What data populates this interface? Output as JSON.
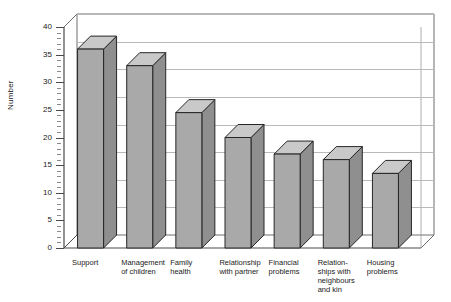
{
  "chart_data": {
    "type": "bar",
    "title": "",
    "subtitle": "",
    "xlabel": "",
    "ylabel": "Number",
    "categories": [
      "Support",
      "Management of children",
      "Family health",
      "Relationship with partner",
      "Financial problems",
      "Relation-ships with neighbours and kin",
      "Housing problems"
    ],
    "category_lines": [
      [
        "Support"
      ],
      [
        "Management",
        "of children"
      ],
      [
        "Family",
        "health"
      ],
      [
        "Relationship",
        "with partner"
      ],
      [
        "Financial",
        "problems"
      ],
      [
        "Relation-",
        "ships with",
        "neighbours",
        "and kin"
      ],
      [
        "Housing",
        "problems"
      ]
    ],
    "values": [
      36,
      33,
      24.5,
      20,
      17,
      16,
      13.5
    ],
    "ylim": [
      0,
      40
    ],
    "yticks": [
      0,
      5,
      10,
      15,
      20,
      25,
      30,
      35,
      40
    ],
    "ytick_labels": [
      "0",
      "5",
      "10",
      "15",
      "20",
      "25",
      "30",
      "35",
      "40"
    ],
    "grid": true,
    "legend": false,
    "style": "3d-column",
    "colors": {
      "bar_front": "#a9a9a9",
      "bar_top": "#c9c9c9",
      "bar_side": "#8f8f8f",
      "bar_outline": "#262626",
      "gridline": "#b9b9b9",
      "axis": "#4a4a4a",
      "background": "#ffffff",
      "text": "#1a1a1a"
    }
  }
}
